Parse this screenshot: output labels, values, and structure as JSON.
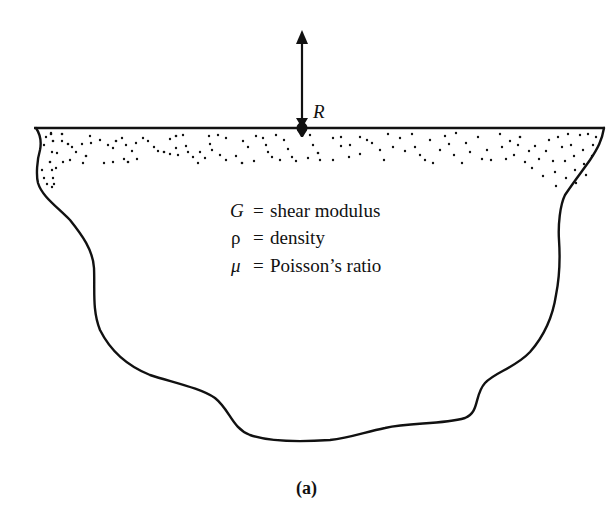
{
  "figure": {
    "caption": "(a)",
    "force_label": "R",
    "surface": "elastic half-space with loaded surface",
    "properties": [
      {
        "symbol": "G",
        "equals": "=",
        "definition": "shear modulus"
      },
      {
        "symbol": "ρ",
        "equals": "=",
        "definition": "density"
      },
      {
        "symbol": "μ",
        "equals": "=",
        "definition": "Poisson’s ratio"
      }
    ],
    "icons": {
      "force_arrow": "arrow-up-icon",
      "contact_point": "filled-dot-icon"
    },
    "colors": {
      "ink": "#111111",
      "background": "#ffffff"
    }
  }
}
